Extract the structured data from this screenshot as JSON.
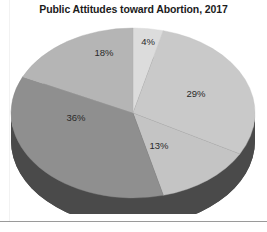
{
  "chart_data": {
    "type": "pie",
    "title": "Public Attitudes toward Abortion, 2017",
    "xlabel": "",
    "ylabel": "",
    "legend_position": "none",
    "grid": false,
    "three_d": true,
    "categories": [
      "4%",
      "29%",
      "13%",
      "36%",
      "18%"
    ],
    "values": [
      4,
      29,
      13,
      36,
      18
    ],
    "labels": [
      "4%",
      "29%",
      "13%",
      "36%",
      "18%"
    ],
    "slices": [
      {
        "label": "4%",
        "value": 4,
        "color": "#dcdcdc"
      },
      {
        "label": "29%",
        "value": 29,
        "color": "#c9c9c9"
      },
      {
        "label": "13%",
        "value": 13,
        "color": "#c4c4c4"
      },
      {
        "label": "36%",
        "value": 36,
        "color": "#8f8f8f"
      },
      {
        "label": "18%",
        "value": 18,
        "color": "#b5b5b5"
      }
    ],
    "colors": [
      "#dcdcdc",
      "#c9c9c9",
      "#c4c4c4",
      "#8f8f8f",
      "#b5b5b5"
    ],
    "side_color": "#4a4a4a",
    "total": 100
  },
  "figure": {
    "title": "Public Attitudes toward Abortion, 2017",
    "background": "#ffffff",
    "border_color": "#9a9a9a"
  }
}
